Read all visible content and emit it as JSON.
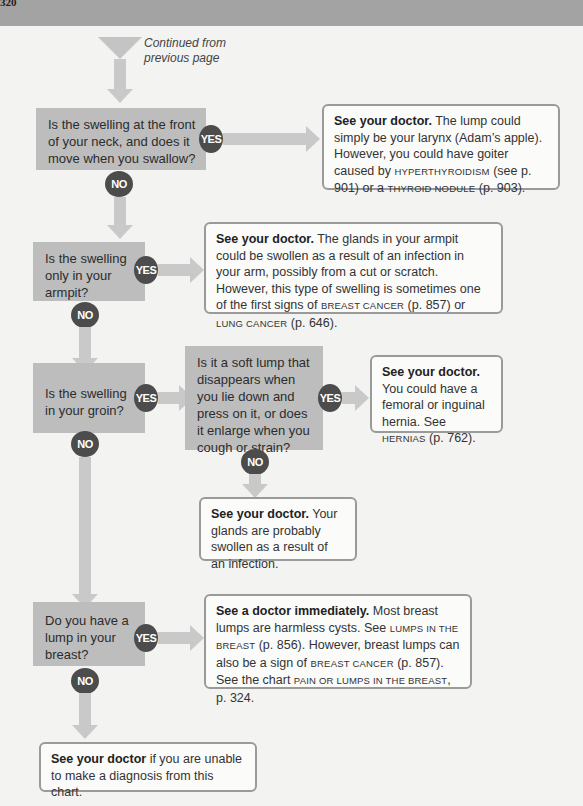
{
  "page": {
    "page_number": "320",
    "continued_note": "Continued from previous page"
  },
  "colors": {
    "question_box": "#bdbdbd",
    "answer_border": "#9a9a9a",
    "badge": "#4c4c4c",
    "arrow": "#c9c9c9",
    "header_band": "#a3a3a3"
  },
  "labels": {
    "yes": "YES",
    "no": "NO"
  },
  "questions": [
    {
      "id": "q1",
      "text": "Is the swelling at the front of your neck, and does it move when you swallow?"
    },
    {
      "id": "q2",
      "text": "Is the swelling only in your armpit?"
    },
    {
      "id": "q3",
      "text": "Is the swelling in your groin?"
    },
    {
      "id": "q3b",
      "text": "Is it a soft lump that disappears when you lie down and press on it, or does it enlarge when you cough or strain?"
    },
    {
      "id": "q4",
      "text": "Do you have a lump in your breast?"
    }
  ],
  "answers": {
    "a1": {
      "lead": "See your doctor.",
      "t1": " The lump could simply be your larynx (Adam’s apple). However, you could have goiter caused by ",
      "ref1": "HYPERTHYROIDISM",
      "t2": " (see p. 901) or a ",
      "ref2": "THYROID NODULE",
      "t3": " (p. 903)."
    },
    "a2": {
      "lead": "See your doctor.",
      "t1": " The glands in your armpit could be swollen as a result of an infection in your arm, possibly from a cut or scratch. However, this type of swelling is sometimes one of the first signs of ",
      "ref1": "BREAST CANCER",
      "t2": " (p. 857) or ",
      "ref2": "LUNG CANCER",
      "t3": " (p. 646)."
    },
    "a3": {
      "lead": "See your doctor.",
      "t1": " You could have a femoral or inguinal hernia. See ",
      "ref1": "HERNIAS",
      "t2": " (p. 762)."
    },
    "a3b": {
      "lead": "See your doctor.",
      "t1": " Your glands are probably swollen as a result of an infection."
    },
    "a4": {
      "lead": "See a doctor immediately.",
      "t1": " Most breast lumps are harmless cysts. See ",
      "ref1": "LUMPS IN THE BREAST",
      "t2": " (p. 856). However, breast lumps can also be a sign of ",
      "ref2": "BREAST CANCER",
      "t3": " (p. 857). See the chart ",
      "ref3": "PAIN OR LUMPS IN THE BREAST",
      "t4": ", p. 324."
    },
    "final": {
      "lead": "See your doctor",
      "t1": " if you are unable to make a diagnosis from this chart."
    }
  }
}
